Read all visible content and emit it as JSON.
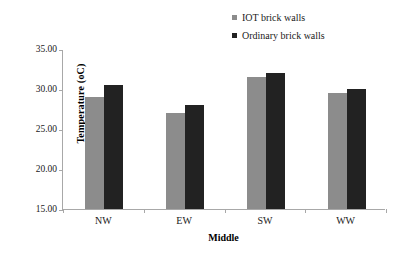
{
  "chart_data": {
    "type": "bar",
    "title": "",
    "subtitle": "",
    "xlabel": "Middle",
    "ylabel": "Temperature (oC)",
    "categories": [
      "NW",
      "EW",
      "SW",
      "WW"
    ],
    "series": [
      {
        "name": "IOT brick walls",
        "color": "#8c8c8c",
        "values": [
          29.0,
          27.0,
          31.5,
          29.5
        ]
      },
      {
        "name": "Ordinary brick walls",
        "color": "#222222",
        "values": [
          30.5,
          28.0,
          32.0,
          30.0
        ]
      }
    ],
    "ylim": [
      15.0,
      35.0
    ],
    "ytick_values": [
      35.0,
      30.0,
      25.0,
      20.0,
      15.0
    ],
    "ytick_labels": [
      "35.00",
      "30.00",
      "25.00",
      "20.00",
      "15.00"
    ],
    "grid": false,
    "legend_position": "top-right",
    "legend_marker": "square"
  }
}
